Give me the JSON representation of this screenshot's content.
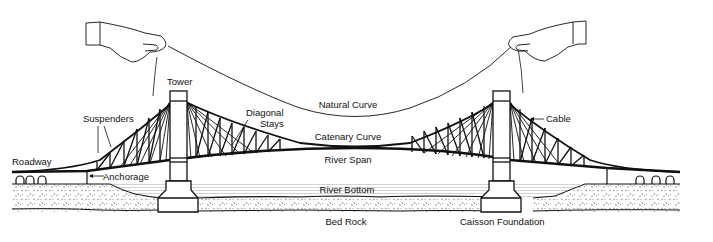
{
  "diagram": {
    "colors": {
      "line": "#111111",
      "background": "#ffffff",
      "water": "#bfbfbf",
      "rock_speck": "#555555"
    },
    "labels": {
      "tower": "Tower",
      "suspenders": "Suspenders",
      "diagonal_stays_line1": "Diagonal",
      "diagonal_stays_line2": "Stays",
      "natural_curve": "Natural Curve",
      "catenary_curve": "Catenary Curve",
      "river_span": "River Span",
      "cable": "Cable",
      "roadway": "Roadway",
      "anchorage": "Anchorage",
      "river_bottom": "River Bottom",
      "bed_rock": "Bed Rock",
      "caisson_foundation": "Caisson Foundation"
    },
    "icons": {
      "left_hand": "hand-holding-string-icon",
      "right_hand": "hand-holding-string-icon",
      "arrow": "arrow-left"
    }
  }
}
